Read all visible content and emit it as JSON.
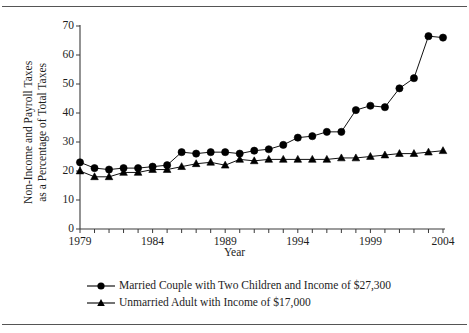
{
  "chart_data": {
    "type": "line",
    "title": "",
    "xlabel": "Year",
    "ylabel": "Non-Income and Payroll Taxes as a Percentage of Total Taxes",
    "ylabel_line1": "Non-Income and Payroll Taxes",
    "ylabel_line2": "as a Percentage of Total Taxes",
    "xlim": [
      1979,
      2004
    ],
    "ylim": [
      0,
      70
    ],
    "grid": false,
    "legend_position": "below-plot",
    "y_ticks": [
      0,
      10,
      20,
      30,
      40,
      50,
      60,
      70
    ],
    "x_ticks": [
      1979,
      1980,
      1981,
      1982,
      1983,
      1984,
      1985,
      1986,
      1987,
      1988,
      1989,
      1990,
      1991,
      1992,
      1993,
      1994,
      1995,
      1996,
      1997,
      1998,
      1999,
      2000,
      2001,
      2002,
      2003,
      2004
    ],
    "x_tick_labels": [
      "1979",
      "1984",
      "1989",
      "1994",
      "1999",
      "2004"
    ],
    "x_tick_label_years": [
      1979,
      1984,
      1989,
      1994,
      1999,
      2004
    ],
    "x": [
      1979,
      1980,
      1981,
      1982,
      1983,
      1984,
      1985,
      1986,
      1987,
      1988,
      1989,
      1990,
      1991,
      1992,
      1993,
      1994,
      1995,
      1996,
      1997,
      1998,
      1999,
      2000,
      2001,
      2002,
      2003,
      2004
    ],
    "series": [
      {
        "name": "Married Couple with Two Children and Income of $27,300",
        "marker": "circle",
        "color": "#000000",
        "values": [
          23.0,
          21.0,
          20.5,
          21.0,
          21.0,
          21.5,
          22.0,
          26.5,
          26.0,
          26.5,
          26.5,
          26.0,
          27.0,
          27.5,
          29.0,
          31.5,
          32.0,
          33.5,
          33.5,
          41.0,
          42.5,
          42.0,
          48.5,
          52.0,
          66.5,
          66.0
        ]
      },
      {
        "name": "Unmarried Adult with Income of $17,000",
        "marker": "triangle",
        "color": "#000000",
        "values": [
          20.0,
          18.0,
          18.0,
          19.5,
          19.5,
          20.5,
          20.5,
          21.5,
          22.5,
          23.0,
          22.0,
          24.0,
          23.5,
          24.0,
          24.0,
          24.0,
          24.0,
          24.0,
          24.5,
          24.5,
          25.0,
          25.5,
          26.0,
          26.0,
          26.5,
          27.0
        ]
      }
    ]
  },
  "legend": {
    "items": [
      {
        "label": "Married Couple with Two Children and Income of $27,300",
        "marker": "circle"
      },
      {
        "label": "Unmarried Adult with Income of $17,000",
        "marker": "triangle"
      }
    ]
  },
  "axes": {
    "x_title": "Year",
    "y_title_line1": "Non-Income and Payroll Taxes",
    "y_title_line2": "as a Percentage of Total Taxes"
  }
}
